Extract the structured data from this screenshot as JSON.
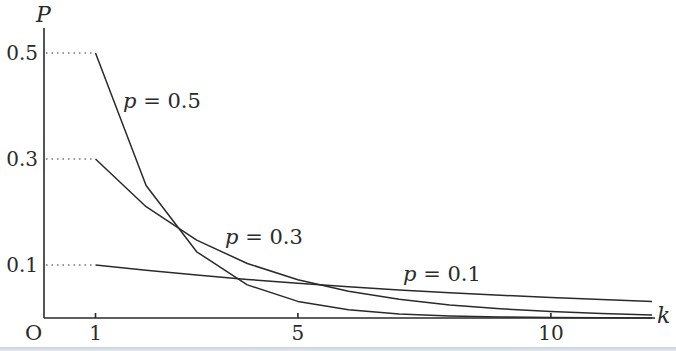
{
  "chart_data": {
    "type": "line",
    "title": "",
    "xlabel": "k",
    "ylabel": "P",
    "origin_label": "O",
    "x_ticks": [
      1,
      5,
      10
    ],
    "x_tick_labels": [
      "1",
      "5",
      "10"
    ],
    "y_ticks": [
      0.1,
      0.3,
      0.5
    ],
    "y_tick_labels": [
      "0.1",
      "0.3",
      "0.5"
    ],
    "xlim": [
      0,
      12.2
    ],
    "ylim": [
      0,
      0.55
    ],
    "grid": false,
    "legend": "inline labels on curves",
    "x": [
      1,
      2,
      3,
      4,
      5,
      6,
      7,
      8,
      9,
      10,
      11,
      12
    ],
    "series": [
      {
        "name": "p = 0.5",
        "label_var": "p",
        "label_val": "= 0.5",
        "values": [
          0.5,
          0.25,
          0.125,
          0.0625,
          0.0313,
          0.0156,
          0.0078,
          0.0039,
          0.002,
          0.001,
          0.0005,
          0.0002
        ]
      },
      {
        "name": "p = 0.3",
        "label_var": "p",
        "label_val": "= 0.3",
        "values": [
          0.3,
          0.21,
          0.147,
          0.1029,
          0.072,
          0.0504,
          0.0353,
          0.0247,
          0.0173,
          0.0121,
          0.0085,
          0.0059
        ]
      },
      {
        "name": "p = 0.1",
        "label_var": "p",
        "label_val": "= 0.1",
        "values": [
          0.1,
          0.09,
          0.081,
          0.0729,
          0.0656,
          0.059,
          0.0531,
          0.0478,
          0.043,
          0.0387,
          0.0349,
          0.0314
        ]
      }
    ]
  },
  "colors": {
    "line": "#2a2a2a",
    "background": "#ffffff",
    "bottom_band": "#c9d2de"
  }
}
